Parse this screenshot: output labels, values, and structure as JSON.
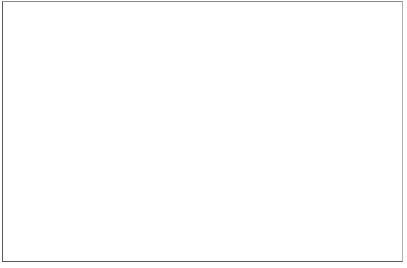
{
  "puzzle": {
    "type": "crossword",
    "origin_x": 38,
    "origin_y": 10,
    "cell_w": 22.9,
    "cell_h": 22,
    "keyword_column": 6,
    "rows": [
      {
        "number": "1",
        "start_col": 6,
        "length": 4
      },
      {
        "number": "2",
        "start_col": 2,
        "length": 6
      },
      {
        "number": "3",
        "start_col": 6,
        "length": 6
      },
      {
        "number": "4",
        "start_col": 4,
        "length": 7
      },
      {
        "number": "5",
        "start_col": 5,
        "length": 7
      },
      {
        "number": "6",
        "start_col": 4,
        "length": 9
      },
      {
        "number": "7",
        "start_col": 6,
        "length": 9
      },
      {
        "number": "8",
        "start_col": 0,
        "length": 9
      },
      {
        "number": "9",
        "start_col": 5,
        "length": 5
      },
      {
        "number": "10",
        "start_col": 5,
        "length": 6
      },
      {
        "number": "11",
        "start_col": 5,
        "length": 8
      }
    ]
  },
  "colors": {
    "line": "#2a2a2a",
    "keyword_line": "#111111",
    "frame": "#5a5a5a"
  }
}
